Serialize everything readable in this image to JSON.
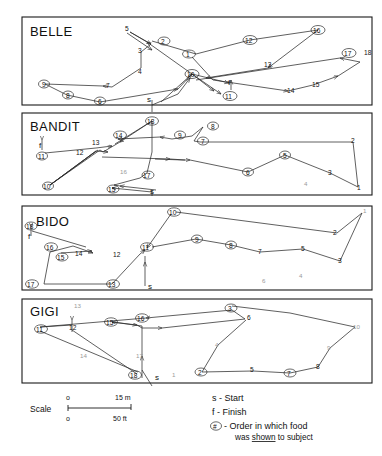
{
  "figure": {
    "panels": [
      {
        "name": "BELLE",
        "start_marker": "s",
        "finish_marker": "f",
        "nodes": [
          {
            "id": "1",
            "x": 0.565,
            "y": 0.52
          },
          {
            "id": "2",
            "x": 0.425,
            "y": 0.33
          },
          {
            "id": "3",
            "x": 0.345,
            "y": 0.47
          },
          {
            "id": "4",
            "x": 0.345,
            "y": 0.72
          },
          {
            "id": "5",
            "x": 0.305,
            "y": 0.16
          },
          {
            "id": "6",
            "x": 0.215,
            "y": 0.95
          },
          {
            "id": "7",
            "x": 0.235,
            "y": 0.79
          },
          {
            "id": "8",
            "x": 0.125,
            "y": 0.88
          },
          {
            "id": "9",
            "x": 0.055,
            "y": 0.76
          },
          {
            "id": "10",
            "x": 0.53,
            "y": 0.79
          },
          {
            "id": "11",
            "x": 0.635,
            "y": 0.95
          },
          {
            "id": "12",
            "x": 0.65,
            "y": 0.27
          },
          {
            "id": "13",
            "x": 0.7,
            "y": 0.58
          },
          {
            "id": "14",
            "x": 0.775,
            "y": 0.88
          },
          {
            "id": "15",
            "x": 0.83,
            "y": 0.8
          },
          {
            "id": "16",
            "x": 0.83,
            "y": 0.16
          },
          {
            "id": "17",
            "x": 0.94,
            "y": 0.47
          },
          {
            "id": "18",
            "x": 0.985,
            "y": 0.48
          }
        ]
      },
      {
        "name": "BANDIT",
        "start_marker": "s",
        "finish_marker": "f",
        "nodes": [
          {
            "id": "1",
            "x": 0.975,
            "y": 0.9
          },
          {
            "id": "2",
            "x": 0.955,
            "y": 0.36
          },
          {
            "id": "3",
            "x": 0.885,
            "y": 0.71
          },
          {
            "id": "4",
            "x": 0.82,
            "y": 0.88,
            "faint": true
          },
          {
            "id": "5",
            "x": 0.745,
            "y": 0.52
          },
          {
            "id": "6",
            "x": 0.625,
            "y": 0.68
          },
          {
            "id": "7",
            "x": 0.51,
            "y": 0.36
          },
          {
            "id": "8",
            "x": 0.545,
            "y": 0.14
          },
          {
            "id": "9",
            "x": 0.455,
            "y": 0.29
          },
          {
            "id": "10",
            "x": 0.055,
            "y": 0.94
          },
          {
            "id": "11",
            "x": 0.075,
            "y": 0.62
          },
          {
            "id": "12",
            "x": 0.175,
            "y": 0.59
          },
          {
            "id": "13",
            "x": 0.215,
            "y": 0.47
          },
          {
            "id": "14",
            "x": 0.285,
            "y": 0.28
          },
          {
            "id": "15",
            "x": 0.265,
            "y": 0.94
          },
          {
            "id": "16",
            "x": 0.295,
            "y": 0.76,
            "faint": true
          },
          {
            "id": "17",
            "x": 0.36,
            "y": 0.76
          },
          {
            "id": "18",
            "x": 0.36,
            "y": 0.12
          }
        ]
      },
      {
        "name": "BIDO",
        "start_marker": "s",
        "finish_marker": "f",
        "nodes": [
          {
            "id": "1",
            "x": 0.98,
            "y": 0.14
          },
          {
            "id": "2",
            "x": 0.9,
            "y": 0.33
          },
          {
            "id": "3",
            "x": 0.895,
            "y": 0.64
          },
          {
            "id": "4",
            "x": 0.8,
            "y": 0.84,
            "faint": true
          },
          {
            "id": "5",
            "x": 0.76,
            "y": 0.55
          },
          {
            "id": "6",
            "x": 0.69,
            "y": 0.88,
            "faint": true
          },
          {
            "id": "7",
            "x": 0.625,
            "y": 0.55
          },
          {
            "id": "8",
            "x": 0.545,
            "y": 0.43
          },
          {
            "id": "9",
            "x": 0.48,
            "y": 0.36
          },
          {
            "id": "10",
            "x": 0.43,
            "y": 0.12
          },
          {
            "id": "11",
            "x": 0.37,
            "y": 0.49
          },
          {
            "id": "12",
            "x": 0.265,
            "y": 0.62
          },
          {
            "id": "13",
            "x": 0.285,
            "y": 0.93
          },
          {
            "id": "14",
            "x": 0.175,
            "y": 0.58
          },
          {
            "id": "15",
            "x": 0.135,
            "y": 0.62
          },
          {
            "id": "16",
            "x": 0.115,
            "y": 0.5
          },
          {
            "id": "17",
            "x": 0.04,
            "y": 0.92
          },
          {
            "id": "18",
            "x": 0.055,
            "y": 0.24
          }
        ]
      },
      {
        "name": "GIGI",
        "start_marker": "s",
        "finish_marker": "f",
        "nodes": [
          {
            "id": "1",
            "x": 0.4,
            "y": 0.93,
            "faint": true
          },
          {
            "id": "2",
            "x": 0.47,
            "y": 0.9
          },
          {
            "id": "3",
            "x": 0.585,
            "y": 0.12
          },
          {
            "id": "4",
            "x": 0.545,
            "y": 0.6,
            "faint": true
          },
          {
            "id": "5",
            "x": 0.64,
            "y": 0.82
          },
          {
            "id": "6",
            "x": 0.66,
            "y": 0.27
          },
          {
            "id": "7",
            "x": 0.74,
            "y": 0.9
          },
          {
            "id": "8",
            "x": 0.815,
            "y": 0.83
          },
          {
            "id": "9",
            "x": 0.835,
            "y": 0.58,
            "faint": true
          },
          {
            "id": "10",
            "x": 0.93,
            "y": 0.34
          },
          {
            "id": "11",
            "x": 0.045,
            "y": 0.43
          },
          {
            "id": "12",
            "x": 0.13,
            "y": 0.42
          },
          {
            "id": "13",
            "x": 0.145,
            "y": 0.08,
            "faint": true
          },
          {
            "id": "14",
            "x": 0.205,
            "y": 0.73,
            "faint": true
          },
          {
            "id": "15",
            "x": 0.305,
            "y": 0.31
          },
          {
            "id": "16",
            "x": 0.37,
            "y": 0.22
          },
          {
            "id": "17",
            "x": 0.355,
            "y": 0.72,
            "faint": true
          },
          {
            "id": "18",
            "x": 0.33,
            "y": 0.95
          }
        ]
      }
    ]
  },
  "scale": {
    "label": "Scale",
    "top_zero": "o",
    "top_value": "15 m",
    "bottom_zero": "o",
    "bottom_value": "50 ft"
  },
  "legend": {
    "start": "s - Start",
    "finish": "f - Finish",
    "order_symbol": "#",
    "order_line1": "- Order in which food",
    "order_line2_a": "was ",
    "order_line2_b": "shown",
    "order_line2_c": " to subject"
  },
  "colors": {
    "ink": "#1a1a1a",
    "line": "#2b2b2b",
    "faint": "#9a9a9a",
    "background": "#ffffff"
  }
}
